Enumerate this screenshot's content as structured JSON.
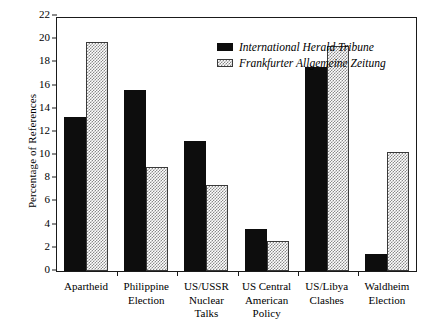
{
  "chart_data": {
    "type": "bar",
    "title": "",
    "xlabel": "",
    "ylabel": "Percentage of References",
    "ylim": [
      0,
      22
    ],
    "ytick_step": 2,
    "yticks": [
      0,
      2,
      4,
      6,
      8,
      10,
      12,
      14,
      16,
      18,
      20,
      22
    ],
    "grid": false,
    "legend_position": "top-right inside",
    "categories": [
      "Apartheid",
      "Philippine\nElection",
      "US/USSR\nNuclear\nTalks",
      "US Central\nAmerican\nPolicy",
      "US/Libya\nClashes",
      "Waldheim\nElection"
    ],
    "series": [
      {
        "name": "International Herald Tribune",
        "fill": "solid-black",
        "color": "#0d0d0d",
        "values": [
          13.3,
          15.6,
          11.2,
          3.6,
          17.6,
          1.5
        ]
      },
      {
        "name": "Frankfurter Allgemeine Zeitung",
        "fill": "crosshatch-gray",
        "color": "#8a8a8a",
        "values": [
          19.8,
          9.0,
          7.4,
          2.6,
          19.4,
          10.3
        ]
      }
    ]
  },
  "axis": {
    "y_title": "Percentage of References"
  },
  "legend": {
    "items": [
      {
        "label": "International Herald Tribune",
        "swatch": "solid"
      },
      {
        "label": "Frankfurter Allgemeine Zeitung",
        "swatch": "hatch"
      }
    ]
  }
}
